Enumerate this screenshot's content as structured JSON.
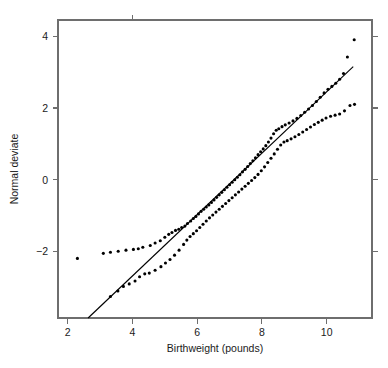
{
  "chart_data": {
    "type": "scatter",
    "title": "",
    "subtitle": "",
    "xlabel": "Birthweight (pounds)",
    "ylabel": "Normal deviate",
    "xlim": [
      1.7,
      11.4
    ],
    "ylim": [
      -3.85,
      4.45
    ],
    "xticks": [
      2,
      4,
      6,
      8,
      10
    ],
    "xtick_labels": [
      "2",
      "4",
      "6",
      "8",
      "10"
    ],
    "yticks": [
      -2,
      0,
      2,
      4
    ],
    "ytick_labels": [
      "-2",
      "0",
      "2",
      "4"
    ],
    "grid": false,
    "legend": false,
    "legend_position": "none",
    "annotations": [],
    "point_color": "#000000",
    "line_color": "#000000",
    "axis_color": "#6e6e6e",
    "background": "#ffffff",
    "reference_line": {
      "name": "Fitted normal line",
      "x_start": 2.63,
      "y_start": -3.85,
      "x_end": 10.82,
      "y_end": 3.15
    },
    "series": [
      {
        "name": "Upper series",
        "marker": "circle",
        "points": [
          [
            2.3,
            -2.19
          ],
          [
            3.1,
            -2.05
          ],
          [
            3.32,
            -2.02
          ],
          [
            3.56,
            -1.99
          ],
          [
            3.8,
            -1.96
          ],
          [
            4.03,
            -1.94
          ],
          [
            4.18,
            -1.92
          ],
          [
            4.32,
            -1.88
          ],
          [
            4.55,
            -1.83
          ],
          [
            4.7,
            -1.76
          ],
          [
            4.86,
            -1.7
          ],
          [
            5.0,
            -1.6
          ],
          [
            5.12,
            -1.52
          ],
          [
            5.22,
            -1.47
          ],
          [
            5.33,
            -1.41
          ],
          [
            5.43,
            -1.38
          ],
          [
            5.52,
            -1.33
          ],
          [
            5.62,
            -1.29
          ],
          [
            5.7,
            -1.22
          ],
          [
            5.8,
            -1.15
          ],
          [
            5.88,
            -1.08
          ],
          [
            5.96,
            -1.02
          ],
          [
            6.04,
            -0.95
          ],
          [
            6.12,
            -0.88
          ],
          [
            6.2,
            -0.82
          ],
          [
            6.28,
            -0.76
          ],
          [
            6.36,
            -0.7
          ],
          [
            6.44,
            -0.63
          ],
          [
            6.52,
            -0.56
          ],
          [
            6.6,
            -0.49
          ],
          [
            6.68,
            -0.42
          ],
          [
            6.76,
            -0.35
          ],
          [
            6.84,
            -0.28
          ],
          [
            6.92,
            -0.21
          ],
          [
            7.0,
            -0.14
          ],
          [
            7.08,
            -0.07
          ],
          [
            7.16,
            0.0
          ],
          [
            7.24,
            0.07
          ],
          [
            7.32,
            0.14
          ],
          [
            7.4,
            0.22
          ],
          [
            7.48,
            0.29
          ],
          [
            7.56,
            0.37
          ],
          [
            7.64,
            0.45
          ],
          [
            7.72,
            0.53
          ],
          [
            7.8,
            0.61
          ],
          [
            7.88,
            0.7
          ],
          [
            7.96,
            0.78
          ],
          [
            8.04,
            0.86
          ],
          [
            8.12,
            0.95
          ],
          [
            8.2,
            1.05
          ],
          [
            8.28,
            1.16
          ],
          [
            8.36,
            1.28
          ],
          [
            8.44,
            1.38
          ],
          [
            8.52,
            1.42
          ],
          [
            8.62,
            1.48
          ],
          [
            8.72,
            1.53
          ],
          [
            8.84,
            1.58
          ],
          [
            8.96,
            1.64
          ],
          [
            9.08,
            1.71
          ],
          [
            9.2,
            1.79
          ],
          [
            9.32,
            1.88
          ],
          [
            9.44,
            1.97
          ],
          [
            9.56,
            2.07
          ],
          [
            9.68,
            2.18
          ],
          [
            9.8,
            2.3
          ],
          [
            9.92,
            2.42
          ],
          [
            10.04,
            2.52
          ],
          [
            10.16,
            2.6
          ],
          [
            10.28,
            2.69
          ],
          [
            10.4,
            2.8
          ],
          [
            10.52,
            2.96
          ],
          [
            10.64,
            3.42
          ],
          [
            10.85,
            3.9
          ]
        ]
      },
      {
        "name": "Lower series",
        "marker": "circle",
        "points": [
          [
            3.32,
            -3.25
          ],
          [
            3.55,
            -3.1
          ],
          [
            3.72,
            -2.97
          ],
          [
            3.9,
            -2.9
          ],
          [
            4.08,
            -2.82
          ],
          [
            4.22,
            -2.7
          ],
          [
            4.38,
            -2.62
          ],
          [
            4.52,
            -2.6
          ],
          [
            4.7,
            -2.52
          ],
          [
            4.88,
            -2.42
          ],
          [
            5.02,
            -2.32
          ],
          [
            5.16,
            -2.22
          ],
          [
            5.3,
            -2.1
          ],
          [
            5.44,
            -1.96
          ],
          [
            5.58,
            -1.8
          ],
          [
            5.68,
            -1.68
          ],
          [
            5.78,
            -1.58
          ],
          [
            5.88,
            -1.5
          ],
          [
            5.98,
            -1.42
          ],
          [
            6.08,
            -1.33
          ],
          [
            6.18,
            -1.24
          ],
          [
            6.28,
            -1.15
          ],
          [
            6.38,
            -1.06
          ],
          [
            6.48,
            -0.98
          ],
          [
            6.58,
            -0.9
          ],
          [
            6.68,
            -0.82
          ],
          [
            6.78,
            -0.74
          ],
          [
            6.88,
            -0.66
          ],
          [
            6.98,
            -0.58
          ],
          [
            7.08,
            -0.5
          ],
          [
            7.18,
            -0.42
          ],
          [
            7.28,
            -0.34
          ],
          [
            7.38,
            -0.26
          ],
          [
            7.48,
            -0.18
          ],
          [
            7.58,
            -0.1
          ],
          [
            7.68,
            -0.02
          ],
          [
            7.78,
            0.06
          ],
          [
            7.88,
            0.15
          ],
          [
            7.98,
            0.25
          ],
          [
            8.08,
            0.36
          ],
          [
            8.18,
            0.48
          ],
          [
            8.28,
            0.6
          ],
          [
            8.38,
            0.72
          ],
          [
            8.48,
            0.85
          ],
          [
            8.58,
            0.97
          ],
          [
            8.68,
            1.05
          ],
          [
            8.78,
            1.09
          ],
          [
            8.9,
            1.14
          ],
          [
            9.02,
            1.2
          ],
          [
            9.14,
            1.26
          ],
          [
            9.26,
            1.33
          ],
          [
            9.38,
            1.4
          ],
          [
            9.5,
            1.47
          ],
          [
            9.62,
            1.54
          ],
          [
            9.74,
            1.6
          ],
          [
            9.86,
            1.66
          ],
          [
            9.98,
            1.72
          ],
          [
            10.12,
            1.77
          ],
          [
            10.26,
            1.8
          ],
          [
            10.4,
            1.83
          ],
          [
            10.55,
            1.92
          ],
          [
            10.72,
            2.07
          ],
          [
            10.86,
            2.1
          ]
        ]
      }
    ]
  }
}
